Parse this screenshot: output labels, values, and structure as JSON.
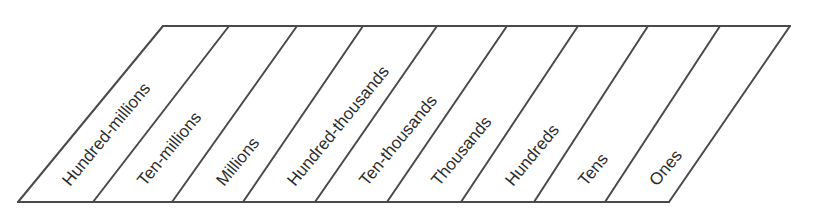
{
  "diagram": {
    "type": "place-value-chart",
    "shape": "slanted parallelogram divided into columns",
    "columns": [
      {
        "label": "Hundred-millions"
      },
      {
        "label": "Ten-millions"
      },
      {
        "label": "Millions"
      },
      {
        "label": "Hundred-thousands"
      },
      {
        "label": "Ten-thousands"
      },
      {
        "label": "Thousands"
      },
      {
        "label": "Hundreds"
      },
      {
        "label": "Tens"
      },
      {
        "label": "Ones"
      }
    ],
    "line_color": "#4a4a4a",
    "text_color": "#2a2a2a",
    "background": "#ffffff"
  }
}
